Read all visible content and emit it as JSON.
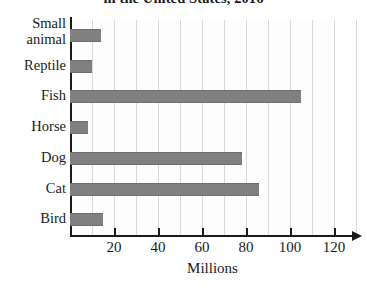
{
  "chart_data": {
    "type": "bar",
    "orientation": "horizontal",
    "title": "in the United States, 2016",
    "xlabel": "Millions",
    "ylabel": "",
    "categories": [
      "Small animal",
      "Reptile",
      "Fish",
      "Horse",
      "Dog",
      "Cat",
      "Bird"
    ],
    "values": [
      14,
      10,
      105,
      8,
      78,
      86,
      15
    ],
    "xlim": [
      0,
      130
    ],
    "xticks": [
      20,
      40,
      60,
      80,
      100,
      120
    ],
    "xtick_labels": [
      "20",
      "40",
      "60",
      "80",
      "100",
      "120"
    ],
    "minor_gridline_step": 10,
    "grid": true,
    "legend": false,
    "bar_color": "#808080",
    "plot_background": "#fdfdfd",
    "axis_color": "#1a1a1a",
    "gridline_color": "#d8d8d8"
  },
  "category_label_lines": [
    [
      "Small",
      "animal"
    ],
    [
      "Reptile"
    ],
    [
      "Fish"
    ],
    [
      "Horse"
    ],
    [
      "Dog"
    ],
    [
      "Cat"
    ],
    [
      "Bird"
    ]
  ]
}
